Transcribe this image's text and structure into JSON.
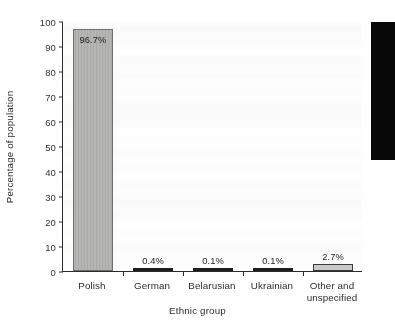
{
  "chart_data": {
    "type": "bar",
    "title": "",
    "xlabel": "Ethnic group",
    "ylabel": "Percentage of population",
    "categories": [
      "Polish",
      "German",
      "Belarusian",
      "Ukrainian",
      "Other and unspecified"
    ],
    "values": [
      96.7,
      0.4,
      0.1,
      0.1,
      2.7
    ],
    "data_labels": [
      "96.7%",
      "0.4%",
      "0.1%",
      "0.1%",
      "2.7%"
    ],
    "ylim": [
      0,
      100
    ],
    "ytick_labels": [
      "0",
      "10",
      "20",
      "30",
      "40",
      "50",
      "60",
      "70",
      "80",
      "90",
      "100"
    ],
    "ytick_values": [
      0,
      10,
      20,
      30,
      40,
      50,
      60,
      70,
      80,
      90,
      100
    ],
    "grid": false,
    "legend": "none",
    "bar_styles": [
      "mid-gray-hatched",
      "dark",
      "dark",
      "dark",
      "light-gray"
    ],
    "colors": {
      "bar_mid_fill": "#a9a9a7",
      "bar_mid_border": "#6e6f6d",
      "bar_light_fill": "#c9c9c7",
      "bar_light_border": "#3a3b39",
      "bar_dark_fill": "#1d1e1c",
      "axis": "#2b2b2b",
      "text": "#2c2d2b",
      "plot_background": "#fdfdfd",
      "page_background": "#ffffff",
      "scan_artifact": "#080808"
    }
  },
  "category_label_lines": [
    [
      "Polish"
    ],
    [
      "German"
    ],
    [
      "Belarusian"
    ],
    [
      "Ukrainian"
    ],
    [
      "Other and",
      "unspecified"
    ]
  ]
}
